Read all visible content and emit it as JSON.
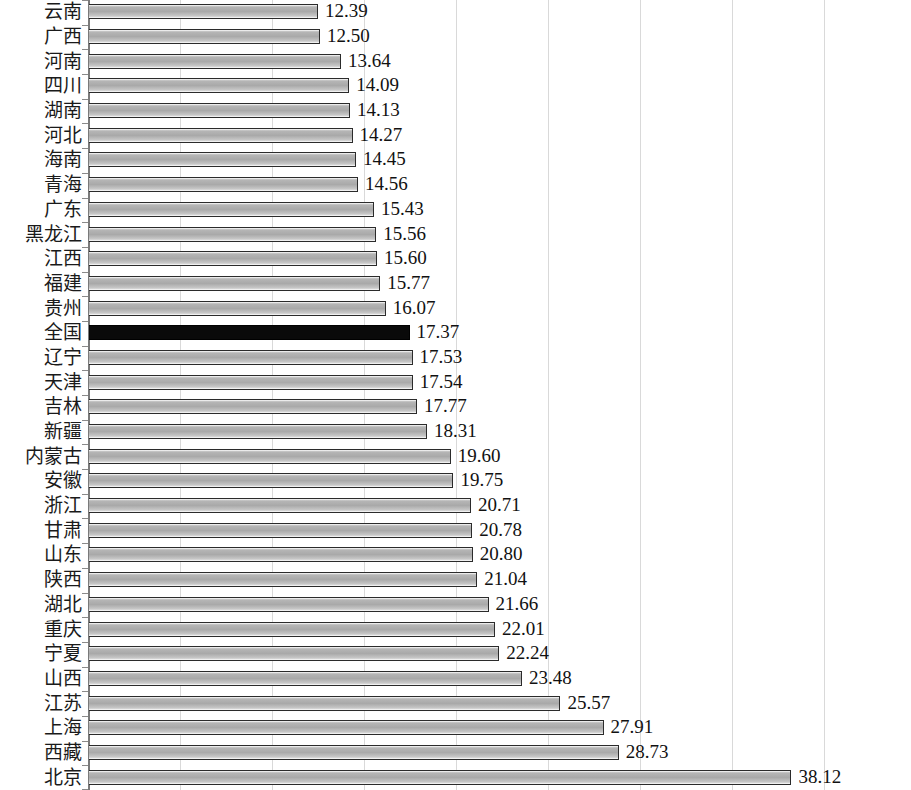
{
  "chart_data": {
    "type": "bar",
    "orientation": "horizontal",
    "title": "",
    "subtitle": "",
    "xlabel": "",
    "ylabel": "",
    "xlim": [
      0,
      44.7
    ],
    "grid": true,
    "gridline_values": [
      5,
      10,
      15,
      20,
      25,
      30,
      35,
      40
    ],
    "legend": [],
    "highlight_category": "全国",
    "highlight_color": "#0a0a0a",
    "bar_color": "#a9a9a9",
    "bar_border_color": "#2b2b2b",
    "gridline_color": "#d9d9d9",
    "axis_color": "#7a7a7a",
    "categories": [
      "云南",
      "广西",
      "河南",
      "四川",
      "湖南",
      "河北",
      "海南",
      "青海",
      "广东",
      "黑龙江",
      "江西",
      "福建",
      "贵州",
      "全国",
      "辽宁",
      "天津",
      "吉林",
      "新疆",
      "内蒙古",
      "安徽",
      "浙江",
      "甘肃",
      "山东",
      "陕西",
      "湖北",
      "重庆",
      "宁夏",
      "山西",
      "江苏",
      "上海",
      "西藏",
      "北京"
    ],
    "values": [
      12.39,
      12.5,
      13.64,
      14.09,
      14.13,
      14.27,
      14.45,
      14.56,
      15.43,
      15.56,
      15.6,
      15.77,
      16.07,
      17.37,
      17.53,
      17.54,
      17.77,
      18.31,
      19.6,
      19.75,
      20.71,
      20.78,
      20.8,
      21.04,
      21.66,
      22.01,
      22.24,
      23.48,
      25.57,
      27.91,
      28.73,
      38.12
    ],
    "value_labels": [
      "12.39",
      "12.50",
      "13.64",
      "14.09",
      "14.13",
      "14.27",
      "14.45",
      "14.56",
      "15.43",
      "15.56",
      "15.60",
      "15.77",
      "16.07",
      "17.37",
      "17.53",
      "17.54",
      "17.77",
      "18.31",
      "19.60",
      "19.75",
      "20.71",
      "20.78",
      "20.80",
      "21.04",
      "21.66",
      "22.01",
      "22.24",
      "23.48",
      "25.57",
      "27.91",
      "28.73",
      "38.12"
    ]
  }
}
